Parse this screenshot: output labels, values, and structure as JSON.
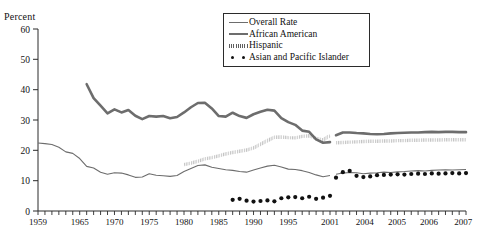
{
  "axis_title": "Percent",
  "legend": {
    "items": [
      {
        "label": "Overall Rate",
        "style": "thin-line",
        "color": "#6d6d6d"
      },
      {
        "label": "African American",
        "style": "thick-line",
        "color": "#6d6d6d"
      },
      {
        "label": "Hispanic",
        "style": "hatched-line",
        "color": "#5f5f5f"
      },
      {
        "label": "Asian and Pacific Islander",
        "style": "dots",
        "color": "#111111"
      }
    ]
  },
  "chart_data": {
    "type": "line",
    "title": "",
    "xlabel": "",
    "ylabel": "Percent",
    "ylim": [
      0,
      60
    ],
    "yticks": [
      0,
      10,
      20,
      30,
      40,
      50,
      60
    ],
    "grid": false,
    "legend_position": "top-right",
    "xtick_labels": [
      "1959",
      "1965",
      "1970",
      "1975",
      "1980",
      "1985",
      "1990",
      "1995",
      "2001",
      "2004",
      "2005",
      "2006",
      "2007"
    ],
    "x_axis_note": "annual ticks 1959-2001, then sub-annual ticks through 2007",
    "series_break_at": 2001,
    "series": [
      {
        "name": "Overall Rate",
        "x": [
          1959,
          1960,
          1961,
          1962,
          1963,
          1964,
          1965,
          1966,
          1967,
          1968,
          1969,
          1970,
          1971,
          1972,
          1973,
          1974,
          1975,
          1976,
          1977,
          1978,
          1979,
          1980,
          1981,
          1982,
          1983,
          1984,
          1985,
          1986,
          1987,
          1988,
          1989,
          1990,
          1991,
          1992,
          1993,
          1994,
          1995,
          1996,
          1997,
          1998,
          1999,
          2000,
          2001
        ],
        "values": [
          22.4,
          22.2,
          21.9,
          21.0,
          19.5,
          19.0,
          17.3,
          14.7,
          14.2,
          12.8,
          12.1,
          12.6,
          12.5,
          11.9,
          11.1,
          11.2,
          12.3,
          11.8,
          11.6,
          11.4,
          11.7,
          13.0,
          14.0,
          15.0,
          15.2,
          14.4,
          14.0,
          13.6,
          13.4,
          13.0,
          12.8,
          13.5,
          14.2,
          14.8,
          15.1,
          14.5,
          13.8,
          13.7,
          13.3,
          12.7,
          11.9,
          11.3,
          11.7
        ],
        "values_after_break": [
          2002,
          2003,
          2004,
          2005,
          2006,
          2007
        ],
        "values_break": [
          12.1,
          12.5,
          12.7,
          12.6,
          12.3,
          12.5,
          12.6,
          12.8,
          12.7,
          12.9,
          13.0,
          13.2,
          13.3,
          13.2,
          13.4,
          13.5,
          13.6,
          13.5,
          13.6,
          13.7
        ]
      },
      {
        "name": "African American",
        "x": [
          1966,
          1967,
          1968,
          1969,
          1970,
          1971,
          1972,
          1973,
          1974,
          1975,
          1976,
          1977,
          1978,
          1979,
          1980,
          1981,
          1982,
          1983,
          1984,
          1985,
          1986,
          1987,
          1988,
          1989,
          1990,
          1991,
          1992,
          1993,
          1994,
          1995,
          1996,
          1997,
          1998,
          1999,
          2000,
          2001
        ],
        "values": [
          41.8,
          37.2,
          34.7,
          32.2,
          33.5,
          32.5,
          33.3,
          31.4,
          30.3,
          31.3,
          31.1,
          31.3,
          30.6,
          31.0,
          32.5,
          34.2,
          35.6,
          35.7,
          33.8,
          31.3,
          31.1,
          32.4,
          31.3,
          30.7,
          31.9,
          32.7,
          33.4,
          33.1,
          30.6,
          29.3,
          28.4,
          26.5,
          26.1,
          23.6,
          22.5,
          22.7
        ],
        "values_break": [
          25.0,
          25.9,
          25.9,
          25.7,
          25.6,
          25.4,
          25.3,
          25.4,
          25.6,
          25.7,
          25.8,
          25.9,
          25.9,
          26.0,
          26.1,
          26.0,
          26.1,
          26.1,
          26.0,
          26.0
        ]
      },
      {
        "name": "Hispanic",
        "x": [
          1980,
          1981,
          1982,
          1983,
          1984,
          1985,
          1986,
          1987,
          1988,
          1989,
          1990,
          1991,
          1992,
          1993,
          1994,
          1995,
          1996,
          1997,
          1998,
          1999,
          2000,
          2001
        ],
        "values": [
          15.3,
          15.8,
          16.4,
          17.2,
          17.6,
          18.2,
          18.8,
          19.3,
          19.7,
          20.1,
          20.8,
          22.0,
          23.2,
          24.3,
          24.4,
          24.2,
          24.1,
          24.6,
          24.8,
          23.9,
          23.4,
          24.9
        ],
        "values_break": [
          22.5,
          22.6,
          22.7,
          22.8,
          22.9,
          23.0,
          23.0,
          23.1,
          23.1,
          23.2,
          23.2,
          23.3,
          23.3,
          23.4,
          23.4,
          23.4,
          23.5,
          23.5,
          23.5,
          23.5
        ]
      },
      {
        "name": "Asian and Pacific Islander",
        "x": [
          1987,
          1988,
          1989,
          1990,
          1991,
          1992,
          1993,
          1994,
          1995,
          1996,
          1997,
          1998,
          1999,
          2000,
          2001
        ],
        "values": [
          3.7,
          4.0,
          3.4,
          3.1,
          3.3,
          3.5,
          3.2,
          4.2,
          4.5,
          4.6,
          4.2,
          4.7,
          4.0,
          4.4,
          5.0
        ],
        "values_break": [
          11.0,
          12.8,
          13.2,
          11.6,
          11.2,
          11.4,
          11.8,
          11.9,
          12.0,
          12.1,
          12.0,
          12.2,
          12.3,
          12.2,
          12.4,
          12.3,
          12.4,
          12.5,
          12.4,
          12.5
        ]
      }
    ]
  }
}
